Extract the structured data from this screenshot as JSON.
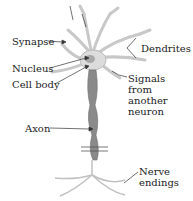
{
  "diagram": {
    "type": "neuron anatomy",
    "labels": {
      "synapse": "Synapse",
      "dendrites": "Dendrites",
      "nucleus": "Nucleus",
      "cell_body": "Cell body",
      "signals_line1": "Signals",
      "signals_line2": "from",
      "signals_line3": "another",
      "signals_line4": "neuron",
      "axon": "Axon",
      "nerve_line1": "Nerve",
      "nerve_line2": "endings"
    },
    "colors": {
      "cell_fill": "#dcdcdc",
      "cell_stroke": "#b8b8b8",
      "axon_fill": "#8a8a8a",
      "nucleus_fill": "#a8a8a8",
      "arrow": "#333333",
      "text": "#222222"
    }
  }
}
